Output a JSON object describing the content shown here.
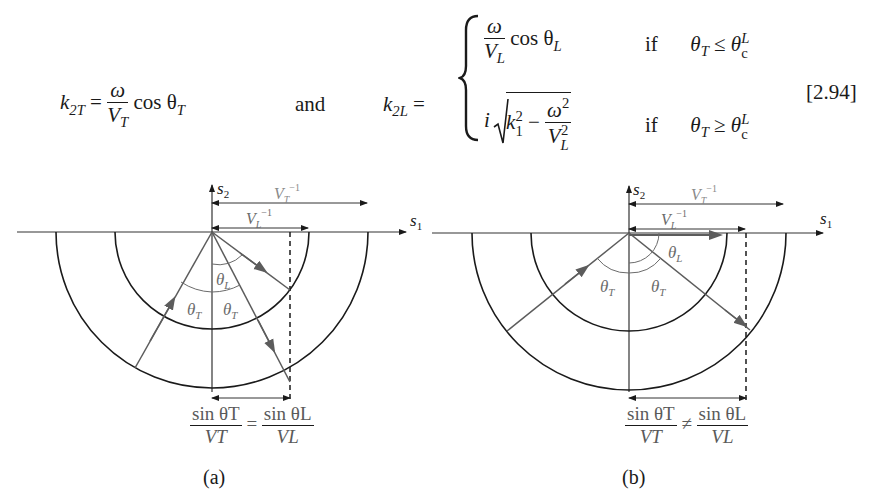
{
  "equation": {
    "number": "[2.94]",
    "k2T": {
      "lhs": "k",
      "lhs_sub": "2T",
      "num": "ω",
      "den": "V",
      "den_sub": "T",
      "func": "cos θ",
      "func_sub": "T"
    },
    "connector": "and",
    "k2L": {
      "lhs": "k",
      "lhs_sub": "2L",
      "case1": {
        "num": "ω",
        "den": "V",
        "den_sub": "L",
        "func": "cos θ",
        "func_sub": "L",
        "cond_word": "if",
        "cond": "θ",
        "cond_sub": "T",
        "rel": "≤",
        "crit": "θ",
        "crit_sup": "L",
        "crit_sub": "c"
      },
      "case2": {
        "prefix": "i",
        "k": "k",
        "k_sub": "1",
        "k_sup": "2",
        "minus": "−",
        "num": "ω",
        "num_sup": "2",
        "den": "V",
        "den_sub": "L",
        "den_sup": "2",
        "cond_word": "if",
        "cond": "θ",
        "cond_sub": "T",
        "rel": "≥",
        "crit": "θ",
        "crit_sup": "L",
        "crit_sub": "c"
      }
    }
  },
  "figures": [
    {
      "id": "a",
      "caption": "(a)",
      "axis_labels": {
        "s1": "s1",
        "s2": "s2"
      },
      "arrow_labels": {
        "VT_inv": "V_T^-1",
        "VL_inv": "V_L^-1"
      },
      "angle_labels": [
        "θL",
        "θT",
        "θT"
      ],
      "relation": {
        "left_num": "sin θT",
        "left_den": "VT",
        "rel": "=",
        "right_num": "sin θL",
        "right_den": "VL"
      }
    },
    {
      "id": "b",
      "caption": "(b)",
      "axis_labels": {
        "s1": "s1",
        "s2": "s2"
      },
      "arrow_labels": {
        "VT_inv": "V_T^-1",
        "VL_inv": "V_L^-1"
      },
      "angle_labels": [
        "θL",
        "θT",
        "θT"
      ],
      "relation": {
        "left_num": "sin θT",
        "left_den": "VT",
        "rel": "≠",
        "right_num": "sin θL",
        "right_den": "VL"
      }
    }
  ],
  "colors": {
    "ink": "#1a1a1a",
    "gray": "#6b6b6b",
    "ray": "#5c5c5c"
  }
}
